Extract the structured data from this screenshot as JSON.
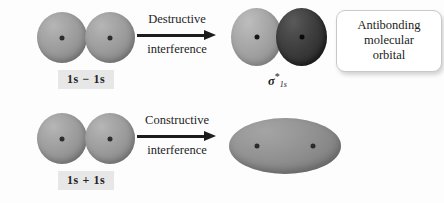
{
  "figure": {
    "background_color": "#fdfdfd"
  },
  "rows": [
    {
      "id": "antibonding",
      "atomic_orbitals": {
        "count": 2,
        "label": "1s",
        "nucleus_icon": "nucleus-dot-icon"
      },
      "combination": {
        "expression": "1s − 1s",
        "chip_background": "#e7e7e7",
        "text_color": "#232323"
      },
      "arrow": {
        "caption_line1": "Destructive",
        "caption_line2": "interference",
        "direction": "right",
        "color": "#1c1c1c"
      },
      "product": {
        "type": "two-lobe",
        "lobes": [
          {
            "phase": "positive",
            "color": "#a2a2a2",
            "shade": "light"
          },
          {
            "phase": "negative",
            "color": "#3c3c3c",
            "shade": "dark"
          }
        ],
        "label_sigma": "σ",
        "label_star": "*",
        "label_subscript": "1s"
      },
      "callout": {
        "line1": "Antibonding",
        "line2": "molecular",
        "line3": "orbital",
        "background": "#ffffff",
        "border_color": "#c9c9c9"
      }
    },
    {
      "id": "bonding",
      "atomic_orbitals": {
        "count": 2,
        "label": "1s",
        "nucleus_icon": "nucleus-dot-icon"
      },
      "combination": {
        "expression": "1s + 1s",
        "chip_background": "#e7e7e7",
        "text_color": "#232323"
      },
      "arrow": {
        "caption_line1": "Constructive",
        "caption_line2": "interference",
        "direction": "right",
        "color": "#1c1c1c"
      },
      "product": {
        "type": "single-lobe",
        "lobes": [
          {
            "phase": "positive",
            "color": "#8e8e8e",
            "shade": "medium"
          }
        ],
        "label_sigma": "σ",
        "label_star": "",
        "label_subscript": "1s"
      },
      "callout": {
        "line1": "Bonding",
        "line2": "molecular",
        "line3": "orbital",
        "background": "#ffffff",
        "border_color": "#c9c9c9"
      }
    }
  ]
}
